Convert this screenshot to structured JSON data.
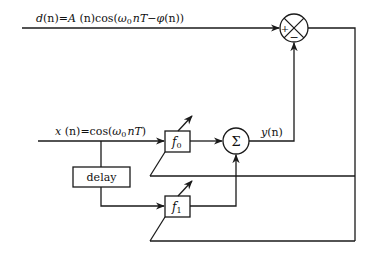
{
  "diagram": {
    "type": "block-diagram",
    "signals": {
      "desired": {
        "label": "d(n)=A(n)cos(ω₀nT−φ(n))",
        "name": "d(n)"
      },
      "input": {
        "label": "x(n)=cos(ω₀nT)",
        "name": "x(n)"
      },
      "output": {
        "label": "y(n)",
        "name": "y(n)"
      }
    },
    "blocks": {
      "delay": {
        "label": "delay"
      },
      "f0": {
        "label": "f",
        "sub": "0"
      },
      "f1": {
        "label": "f",
        "sub": "1"
      },
      "sum": {
        "label": "Σ"
      },
      "error_junction": {
        "plus": "+",
        "minus": "−"
      }
    },
    "edges": [
      {
        "from": "d(n)",
        "to": "error_junction",
        "sign": "+"
      },
      {
        "from": "x(n)",
        "to": "f0"
      },
      {
        "from": "x(n)",
        "to": "delay"
      },
      {
        "from": "delay",
        "to": "f1"
      },
      {
        "from": "f0",
        "to": "sum"
      },
      {
        "from": "f1",
        "to": "sum"
      },
      {
        "from": "sum",
        "to": "error_junction",
        "sign": "-",
        "label": "y(n)"
      },
      {
        "from": "error_junction",
        "to": "f0",
        "type": "adaptation-feedback"
      },
      {
        "from": "error_junction",
        "to": "f1",
        "type": "adaptation-feedback"
      }
    ]
  },
  "labels": {
    "d_prefix": "d",
    "d_n": "(n)=",
    "d_A": "A",
    "d_An": " (n)cos(",
    "d_w": "ω",
    "d_w_sub": "0",
    "d_nT": "nT",
    "d_minus": "−",
    "d_phi": "φ",
    "d_tail": "(n))",
    "x_prefix": "x",
    "x_mid": " (n)=cos(",
    "x_w": "ω",
    "x_w_sub": "0",
    "x_nT": "nT",
    "x_tail": ")",
    "y_label_y": "y",
    "y_label_n": "(n)",
    "delay": "delay",
    "f0": "f",
    "f0_sub": "0",
    "f1": "f",
    "f1_sub": "1",
    "sigma": "Σ",
    "plus": "+",
    "minus": "−"
  }
}
